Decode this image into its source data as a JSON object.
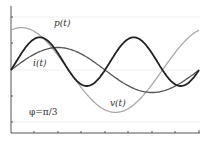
{
  "chart_data": {
    "type": "line",
    "title": "",
    "xlabel": "",
    "ylabel": "",
    "x_range": [
      0,
      8
    ],
    "y_range": [
      -2.4,
      2.4
    ],
    "grid": "horizontal faint",
    "annotation": "φ=π/3",
    "series": [
      {
        "name": "v(t)",
        "label": "v(t)",
        "color": "#a8a8a8",
        "width": 1.3,
        "expr": "1.6*cos(t*2pi/8 - 0.35)",
        "samples": [
          [
            0,
            1.5
          ],
          [
            0.5,
            1.6
          ],
          [
            4.75,
            -1.6
          ],
          [
            8,
            1.45
          ]
        ]
      },
      {
        "name": "i(t)",
        "label": "i(t)",
        "color": "#555555",
        "width": 1.3,
        "expr": "0.85*sin(t*2pi/8)",
        "samples": [
          [
            0,
            0
          ],
          [
            2,
            0.85
          ],
          [
            6,
            -0.85
          ],
          [
            8,
            0
          ]
        ]
      },
      {
        "name": "p(t)",
        "label": "p(t)",
        "color": "#222222",
        "width": 1.8,
        "expr": "v*i",
        "samples": [
          [
            0,
            0
          ],
          [
            1,
            1.85
          ],
          [
            3.25,
            -0.6
          ],
          [
            5.25,
            1.85
          ],
          [
            7.25,
            -0.6
          ],
          [
            8,
            0
          ]
        ]
      }
    ]
  },
  "labels": {
    "p": "p(t)",
    "i": "i(t)",
    "v": "v(t)",
    "phi": "φ=π/3"
  }
}
